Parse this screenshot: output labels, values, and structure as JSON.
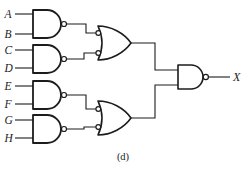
{
  "figure": {
    "caption": "(d)",
    "background": "#ffffff",
    "line_color": "#1c1c1c"
  },
  "inputs": [
    "A",
    "B",
    "C",
    "D",
    "E",
    "F",
    "G",
    "H"
  ],
  "output": {
    "label": "X"
  },
  "circuit": {
    "type": "logic-gate-schematic",
    "gates": [
      {
        "id": "nand1",
        "type": "NAND",
        "inputs": [
          "A",
          "B"
        ]
      },
      {
        "id": "nand2",
        "type": "NAND",
        "inputs": [
          "C",
          "D"
        ]
      },
      {
        "id": "nand3",
        "type": "NAND",
        "inputs": [
          "E",
          "F"
        ]
      },
      {
        "id": "nand4",
        "type": "NAND",
        "inputs": [
          "G",
          "H"
        ]
      },
      {
        "id": "or1",
        "type": "negative-OR (OR with inverted inputs)",
        "inputs": [
          "nand1",
          "nand2"
        ]
      },
      {
        "id": "or2",
        "type": "negative-OR (OR with inverted inputs)",
        "inputs": [
          "nand3",
          "nand4"
        ]
      },
      {
        "id": "nand5",
        "type": "NAND",
        "inputs": [
          "or1",
          "or2"
        ],
        "output": "X"
      }
    ]
  }
}
